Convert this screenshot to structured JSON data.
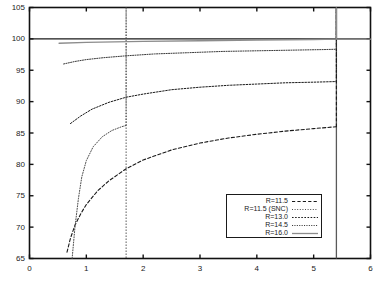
{
  "chart_data": {
    "type": "line",
    "title": "",
    "xlabel": "",
    "ylabel": "",
    "xlim": [
      0,
      6
    ],
    "ylim": [
      65,
      105
    ],
    "xticks": [
      0,
      1,
      2,
      3,
      4,
      5,
      6
    ],
    "yticks": [
      65,
      70,
      75,
      80,
      85,
      90,
      95,
      100,
      105
    ],
    "xtick_labels": [
      "0",
      "1",
      "2",
      "3",
      "4",
      "5",
      "6"
    ],
    "ytick_labels": [
      "65",
      "70",
      "75",
      "80",
      "85",
      "90",
      "95",
      "100",
      "105"
    ],
    "grid": false,
    "legend_position": "lower right",
    "series": [
      {
        "name": "R=11.5",
        "label": "R=11.5",
        "style": "dashed",
        "color": "#1a1a1a",
        "points": [
          [
            0.66,
            66.0
          ],
          [
            0.72,
            68.2
          ],
          [
            0.8,
            70.3
          ],
          [
            0.9,
            72.1
          ],
          [
            1.0,
            73.6
          ],
          [
            1.2,
            75.8
          ],
          [
            1.4,
            77.4
          ],
          [
            1.7,
            79.3
          ],
          [
            2.0,
            80.7
          ],
          [
            2.5,
            82.3
          ],
          [
            3.0,
            83.4
          ],
          [
            3.5,
            84.2
          ],
          [
            4.0,
            84.8
          ],
          [
            4.5,
            85.3
          ],
          [
            5.0,
            85.7
          ],
          [
            5.4,
            86.0
          ]
        ],
        "vertical_jump_at_x": 5.4,
        "vertical_jump_to_y": 105
      },
      {
        "name": "R=11.5 (SNC)",
        "label": "R=11.5 (SNC)",
        "style": "dotted-fine",
        "color": "#4a4a4a",
        "points": [
          [
            0.75,
            65.0
          ],
          [
            0.8,
            70.0
          ],
          [
            0.86,
            74.5
          ],
          [
            0.92,
            78.0
          ],
          [
            1.0,
            80.6
          ],
          [
            1.12,
            82.8
          ],
          [
            1.28,
            84.4
          ],
          [
            1.45,
            85.4
          ],
          [
            1.62,
            86.0
          ],
          [
            1.7,
            86.2
          ]
        ],
        "vertical_at_x": 1.7,
        "vertical_from_y": 86.2,
        "vertical_to_y": 105
      },
      {
        "name": "R=13.0",
        "label": "R=13.0",
        "style": "dotted",
        "color": "#1a1a1a",
        "points": [
          [
            0.72,
            86.5
          ],
          [
            0.9,
            87.7
          ],
          [
            1.1,
            88.8
          ],
          [
            1.4,
            89.9
          ],
          [
            1.7,
            90.7
          ],
          [
            2.0,
            91.2
          ],
          [
            2.5,
            91.9
          ],
          [
            3.0,
            92.3
          ],
          [
            3.5,
            92.6
          ],
          [
            4.0,
            92.8
          ],
          [
            4.5,
            93.0
          ],
          [
            5.0,
            93.1
          ],
          [
            5.4,
            93.2
          ]
        ],
        "vertical_jump_at_x": 5.4,
        "vertical_jump_to_y": 105
      },
      {
        "name": "R=14.5",
        "label": "R=14.5",
        "style": "dotted-dense",
        "color": "#3a3a3a",
        "points": [
          [
            0.6,
            96.0
          ],
          [
            0.8,
            96.4
          ],
          [
            1.0,
            96.7
          ],
          [
            1.3,
            97.0
          ],
          [
            1.7,
            97.3
          ],
          [
            2.2,
            97.6
          ],
          [
            2.8,
            97.8
          ],
          [
            3.4,
            98.0
          ],
          [
            4.0,
            98.1
          ],
          [
            4.6,
            98.2
          ],
          [
            5.2,
            98.3
          ],
          [
            5.4,
            98.35
          ]
        ],
        "vertical_jump_at_x": 5.4,
        "vertical_jump_to_y": 105
      },
      {
        "name": "R=16.0",
        "label": "R=16.0",
        "style": "solid",
        "color": "#8c8c8c",
        "points": [
          [
            0.52,
            99.3
          ],
          [
            1.0,
            99.45
          ],
          [
            2.0,
            99.6
          ],
          [
            3.0,
            99.7
          ],
          [
            4.0,
            99.8
          ],
          [
            5.0,
            99.9
          ],
          [
            5.4,
            99.95
          ],
          [
            6.0,
            99.95
          ]
        ],
        "vertical_jump_at_x": 5.4,
        "vertical_jump_to_y": 105
      }
    ],
    "reference_lines": [
      {
        "name": "y-100-line",
        "orientation": "horizontal",
        "value": 100,
        "style": "solid",
        "color": "#1a1a1a"
      },
      {
        "name": "snc-transition-line",
        "orientation": "vertical",
        "value": 1.7,
        "style": "dotted",
        "color": "#4a4a4a"
      },
      {
        "name": "right-cutoff-line",
        "orientation": "vertical",
        "value": 5.4,
        "style": "solid",
        "color": "#5a5a5a"
      }
    ]
  },
  "legend": {
    "entries": [
      {
        "label": "R=11.5",
        "style": "dashed"
      },
      {
        "label": "R=11.5 (SNC)",
        "style": "dotted-fine"
      },
      {
        "label": "R=13.0",
        "style": "dotted"
      },
      {
        "label": "R=14.5",
        "style": "dotted-dense"
      },
      {
        "label": "R=16.0",
        "style": "solid"
      }
    ]
  }
}
